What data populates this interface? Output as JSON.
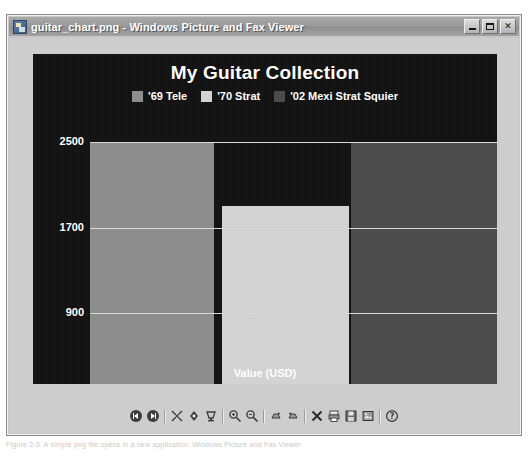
{
  "window": {
    "title": "guitar_chart.png - Windows Picture and Fax Viewer",
    "app_icon": "image-file-icon",
    "controls": [
      {
        "name": "minimize-button",
        "glyph": "_"
      },
      {
        "name": "maximize-button",
        "glyph": "□"
      },
      {
        "name": "close-button",
        "glyph": "✕"
      }
    ]
  },
  "caption": "Figure 2-3. A simple png file opens in a new application: Windows Picture and Fax Viewer",
  "chart_data": {
    "type": "bar",
    "title": "My Guitar Collection",
    "xlabel": "Value (USD)",
    "ylabel": "",
    "orientation": "vertical",
    "categories": [
      "'69 Tele",
      "'70 Strat",
      "'02 Mexi Strat Squier"
    ],
    "values": [
      2500,
      1900,
      2500
    ],
    "series": [
      {
        "name": "'69 Tele",
        "value": 2500,
        "color": "#8c8c8c"
      },
      {
        "name": "'70 Strat",
        "value": 1900,
        "color": "#d2d2d2"
      },
      {
        "name": "'02 Mexi Strat Squier",
        "value": 2500,
        "color": "#4a4a4a"
      }
    ],
    "yticks": [
      2500,
      1700,
      900,
      100
    ],
    "ytick_labels": [
      "2500",
      "1700",
      "900",
      "100"
    ],
    "ylim": [
      100,
      2500
    ],
    "grid": true,
    "legend_position": "top",
    "background_color": "#111111",
    "text_color": "#ffffff",
    "gridline_color": "#d9d9d9"
  },
  "toolbar": {
    "buttons": [
      {
        "name": "previous-image-button",
        "icon": "previous-icon",
        "title": "Previous Image"
      },
      {
        "name": "next-image-button",
        "icon": "next-icon",
        "title": "Next Image"
      },
      {
        "name": "best-fit-button",
        "icon": "best-fit-icon",
        "title": "Best Fit"
      },
      {
        "name": "actual-size-button",
        "icon": "actual-size-icon",
        "title": "Actual Size"
      },
      {
        "name": "start-slideshow-button",
        "icon": "slideshow-icon",
        "title": "Start Slide Show"
      },
      {
        "name": "zoom-in-button",
        "icon": "zoom-in-icon",
        "title": "Zoom In"
      },
      {
        "name": "zoom-out-button",
        "icon": "zoom-out-icon",
        "title": "Zoom Out"
      },
      {
        "name": "rotate-clockwise-button",
        "icon": "rotate-cw-icon",
        "title": "Rotate Clockwise"
      },
      {
        "name": "rotate-counterclockwise-button",
        "icon": "rotate-ccw-icon",
        "title": "Rotate Counterclockwise"
      },
      {
        "name": "delete-button",
        "icon": "delete-x-icon",
        "title": "Delete"
      },
      {
        "name": "print-button",
        "icon": "print-icon",
        "title": "Print"
      },
      {
        "name": "save-as-button",
        "icon": "save-icon",
        "title": "Copy To"
      },
      {
        "name": "open-for-editing-button",
        "icon": "edit-image-icon",
        "title": "Open for Editing"
      },
      {
        "name": "help-button",
        "icon": "help-icon",
        "title": "Help"
      }
    ]
  }
}
